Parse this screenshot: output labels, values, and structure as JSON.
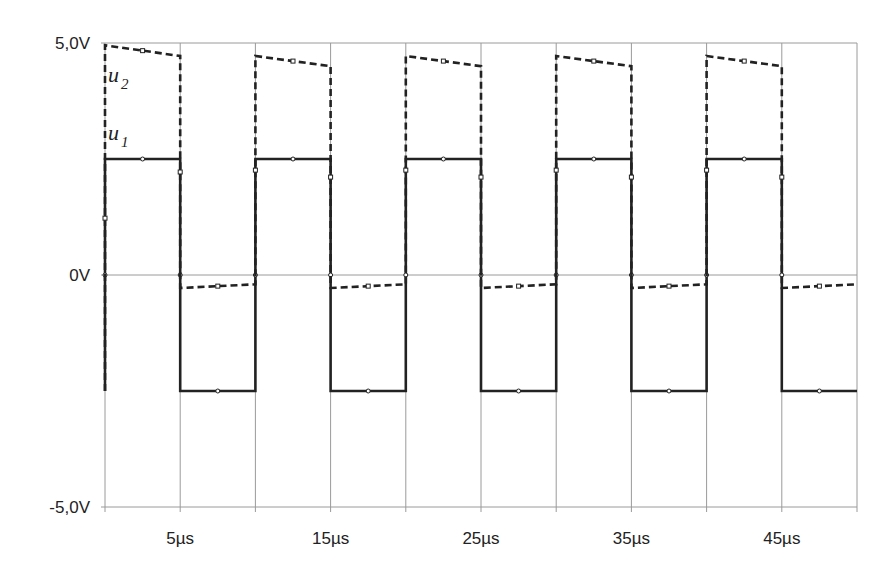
{
  "chart_data": {
    "type": "line",
    "title": "",
    "xlabel": "",
    "ylabel": "",
    "xlim": [
      0,
      50
    ],
    "ylim": [
      -5,
      5
    ],
    "x_unit": "µs",
    "y_unit": "V",
    "y_ticks": [
      {
        "value": 5,
        "label": "5,0V"
      },
      {
        "value": 0,
        "label": "0V"
      },
      {
        "value": -5,
        "label": "-5,0V"
      }
    ],
    "x_ticks": [
      {
        "value": 5,
        "label": "5µs"
      },
      {
        "value": 15,
        "label": "15µs"
      },
      {
        "value": 25,
        "label": "25µs"
      },
      {
        "value": 35,
        "label": "35µs"
      },
      {
        "value": 45,
        "label": "45µs"
      }
    ],
    "x_gridlines": [
      0,
      5,
      10,
      15,
      20,
      25,
      30,
      35,
      40,
      45,
      50
    ],
    "y_gridlines": [
      5,
      0,
      -5
    ],
    "grid": true,
    "legend": "inline labels",
    "series": [
      {
        "name": "u1",
        "label_main": "u",
        "label_sub": "1",
        "style": "solid",
        "color": "#222222",
        "description": "Square wave ±2.5V, period 10µs, high 0–5µs",
        "x": [
          0,
          0,
          5,
          5,
          10,
          10,
          15,
          15,
          20,
          20,
          25,
          25,
          30,
          30,
          35,
          35,
          40,
          40,
          45,
          45,
          50
        ],
        "y": [
          -2.5,
          2.5,
          2.5,
          -2.5,
          -2.5,
          2.5,
          2.5,
          -2.5,
          -2.5,
          2.5,
          2.5,
          -2.5,
          -2.5,
          2.5,
          2.5,
          -2.5,
          -2.5,
          2.5,
          2.5,
          -2.5,
          -2.5
        ]
      },
      {
        "name": "u2",
        "label_main": "u",
        "label_sub": "2",
        "style": "dashed",
        "color": "#222222",
        "description": "Clamped square wave, high ~4.7→4.5V with droop, low ~-0.3→-0.2V",
        "x": [
          0,
          0,
          5,
          5,
          10,
          10,
          15,
          15,
          20,
          20,
          25,
          25,
          30,
          30,
          35,
          35,
          40,
          40,
          45,
          45,
          50
        ],
        "y": [
          -2.5,
          4.95,
          4.72,
          -0.28,
          -0.2,
          4.72,
          4.5,
          -0.28,
          -0.2,
          4.72,
          4.5,
          -0.28,
          -0.2,
          4.72,
          4.5,
          -0.28,
          -0.2,
          4.72,
          4.5,
          -0.28,
          -0.2
        ]
      }
    ]
  }
}
